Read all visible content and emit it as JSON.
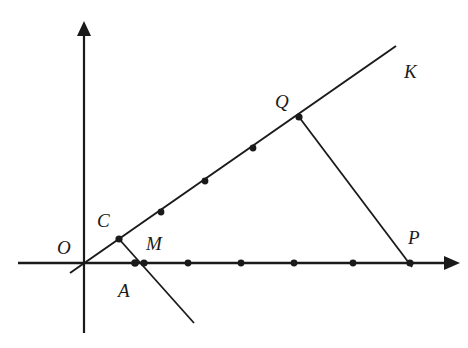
{
  "figure": {
    "colors": {
      "ink": "#1a1a1a",
      "background": "#ffffff"
    },
    "origin": {
      "label": "O",
      "x": 84,
      "y": 263
    },
    "x_axis": {
      "x1": 18,
      "x2": 460,
      "y": 263
    },
    "y_axis": {
      "x": 84,
      "y1": 333,
      "y2": 22
    },
    "ray_OK": {
      "x1": 70,
      "y1": 273,
      "x2": 396,
      "y2": 46,
      "label": "K"
    },
    "segments": [
      {
        "name": "C-M-extension",
        "x1": 119,
        "y1": 239,
        "x2": 194,
        "y2": 323
      },
      {
        "name": "Q-P",
        "x1": 299,
        "y1": 117,
        "x2": 412,
        "y2": 267
      }
    ],
    "points_on_ray": [
      {
        "label": "C",
        "x": 119,
        "y": 239
      },
      {
        "label": "",
        "x": 161,
        "y": 212
      },
      {
        "label": "",
        "x": 205,
        "y": 181
      },
      {
        "label": "",
        "x": 253,
        "y": 148
      },
      {
        "label": "Q",
        "x": 299,
        "y": 117
      }
    ],
    "points_on_x_axis": [
      {
        "label": "A",
        "x": 135,
        "y": 263
      },
      {
        "label": "M",
        "x": 144,
        "y": 263
      },
      {
        "label": "",
        "x": 188,
        "y": 263
      },
      {
        "label": "",
        "x": 241,
        "y": 263
      },
      {
        "label": "",
        "x": 294,
        "y": 263
      },
      {
        "label": "",
        "x": 353,
        "y": 263
      },
      {
        "label": "P",
        "x": 410,
        "y": 263
      }
    ],
    "labels": {
      "O": "O",
      "C": "C",
      "M": "M",
      "A": "A",
      "Q": "Q",
      "K": "K",
      "P": "P"
    }
  }
}
